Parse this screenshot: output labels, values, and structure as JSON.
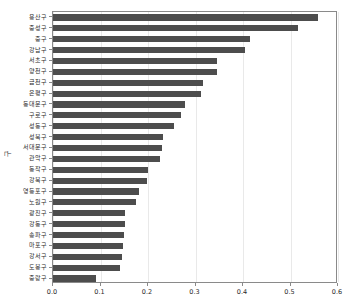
{
  "chart_data": {
    "type": "bar",
    "orientation": "horizontal",
    "title": "",
    "xlabel": "",
    "ylabel": "구",
    "xlim": [
      0.0,
      0.6
    ],
    "xticks": [
      "0.0",
      "0.1",
      "0.2",
      "0.3",
      "0.4",
      "0.5",
      "0.6"
    ],
    "xtick_values": [
      0.0,
      0.1,
      0.2,
      0.3,
      0.4,
      0.5,
      0.6
    ],
    "grid": true,
    "legend": "none",
    "bar_color": "#4d4d4d",
    "categories": [
      "용산구",
      "중성구",
      "중구",
      "강남구",
      "서초구",
      "양천구",
      "금천구",
      "은평구",
      "동대문구",
      "구로구",
      "성동구",
      "성북구",
      "서대문구",
      "관악구",
      "동작구",
      "강북구",
      "영등포구",
      "노원구",
      "광진구",
      "강동구",
      "송파구",
      "마포구",
      "강서구",
      "도봉구",
      "중랑구"
    ],
    "values": [
      0.557,
      0.515,
      0.415,
      0.405,
      0.345,
      0.345,
      0.315,
      0.312,
      0.278,
      0.27,
      0.255,
      0.232,
      0.23,
      0.225,
      0.2,
      0.197,
      0.18,
      0.175,
      0.152,
      0.152,
      0.15,
      0.148,
      0.145,
      0.14,
      0.09
    ]
  }
}
